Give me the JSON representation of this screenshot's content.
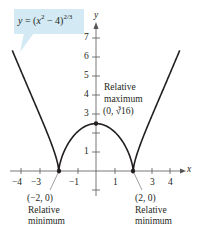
{
  "chart_data": {
    "type": "line",
    "title": "",
    "function": "y = (x^2 - 4)^(2/3)",
    "xlabel": "x",
    "ylabel": "y",
    "xlim": [
      -4.5,
      4.5
    ],
    "ylim": [
      -1,
      7.5
    ],
    "x_ticks": [
      -4,
      -3,
      -2,
      -1,
      1,
      2,
      3,
      4
    ],
    "x_tick_labels": [
      "-4",
      "-3",
      "-1",
      "1",
      "3",
      "4"
    ],
    "y_ticks": [
      -1,
      1,
      2,
      3,
      4,
      5,
      6,
      7
    ],
    "y_tick_labels": [
      "1",
      "3",
      "4",
      "5",
      "6",
      "7"
    ],
    "grid": false,
    "series": [
      {
        "name": "y = (x^2 - 4)^(2/3)",
        "x": [
          -4.5,
          -4,
          -3.5,
          -3,
          -2.5,
          -2,
          -1.5,
          -1,
          -0.5,
          0,
          0.5,
          1,
          1.5,
          2,
          2.5,
          3,
          3.5,
          4,
          4.5
        ],
        "y": [
          6.42,
          5.24,
          4.26,
          2.92,
          1.73,
          0,
          1.45,
          2.08,
          2.38,
          2.52,
          2.38,
          2.08,
          1.45,
          0,
          1.73,
          2.92,
          4.26,
          5.24,
          6.42
        ]
      }
    ],
    "points": [
      {
        "x": -2,
        "y": 0,
        "label": "(−2, 0)",
        "note": "Relative minimum"
      },
      {
        "x": 0,
        "y": 2.52,
        "label": "(0, ∛16)",
        "note": "Relative maximum"
      },
      {
        "x": 2,
        "y": 0,
        "label": "(2, 0)",
        "note": "Relative minimum"
      }
    ],
    "annotations": {
      "equation": "y = (x² − 4)^(2/3)",
      "max_title": "Relative",
      "max_title2": "maximum",
      "max_coord": "(0, ∛16)",
      "min_left_coord": "(−2, 0)",
      "min_right_coord": "(2, 0)",
      "min_title": "Relative",
      "min_title2": "minimum"
    }
  },
  "labels": {
    "eq_y": "y",
    "eq_eq": " = (",
    "eq_x": "x",
    "eq_sq": "2",
    "eq_rest": " − 4)",
    "eq_exp": "2/3",
    "axis_x": "x",
    "axis_y": "y",
    "tick_x_m4": "−4",
    "tick_x_m3": "−3",
    "tick_x_m1": "−1",
    "tick_x_1": "1",
    "tick_x_3": "3",
    "tick_x_4": "4",
    "tick_y_1": "1",
    "tick_y_3": "3",
    "tick_y_4": "4",
    "tick_y_5": "5",
    "tick_y_6": "6",
    "tick_y_7": "7",
    "max_line1": "Relative",
    "max_line2": "maximum",
    "max_coord_open": "(0, ",
    "max_root_idx": "3",
    "max_root": "√16",
    "max_coord_close": ")",
    "minl_coord": "(−2, 0)",
    "minl_line1": "Relative",
    "minl_line2": "minimum",
    "minr_coord": "(2, 0)",
    "minr_line1": "Relative",
    "minr_line2": "minimum"
  },
  "colors": {
    "curve": "#231f20",
    "axis": "#555555",
    "callout_bg": "#d3e9f3"
  }
}
